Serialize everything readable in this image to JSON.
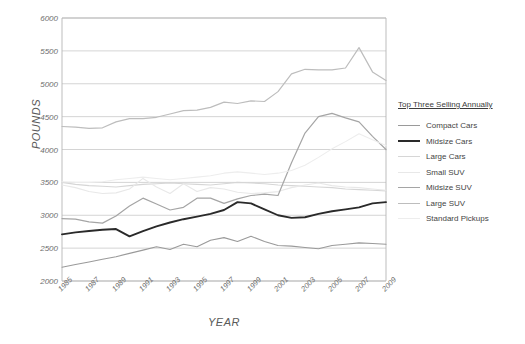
{
  "chart_data": {
    "type": "line",
    "title": "",
    "xlabel": "YEAR",
    "ylabel": "POUNDS",
    "ylim": [
      2000,
      6000
    ],
    "ytick_values": [
      2000,
      2500,
      3000,
      3500,
      4000,
      4500,
      5000,
      5500,
      6000
    ],
    "xlim": [
      1985,
      2009
    ],
    "grid": true,
    "legend_position": "right",
    "legend_title": "Top Three Selling Annually",
    "x": [
      1985,
      1986,
      1987,
      1988,
      1989,
      1990,
      1991,
      1992,
      1993,
      1994,
      1995,
      1996,
      1997,
      1998,
      1999,
      2000,
      2001,
      2002,
      2003,
      2004,
      2005,
      2006,
      2007,
      2008,
      2009
    ],
    "xtick_labels": [
      "1985",
      "1987",
      "1989",
      "1991",
      "1993",
      "1995",
      "1997",
      "1999",
      "2001",
      "2003",
      "2005",
      "2007",
      "2009"
    ],
    "series": [
      {
        "name": "Compact Cars",
        "color": "#9a9a9a",
        "width": 1.1,
        "values": [
          2210,
          2250,
          2290,
          2330,
          2370,
          2420,
          2470,
          2520,
          2480,
          2560,
          2520,
          2620,
          2660,
          2600,
          2680,
          2600,
          2540,
          2530,
          2510,
          2490,
          2540,
          2560,
          2580,
          2570,
          2560
        ]
      },
      {
        "name": "Midsize Cars",
        "color": "#2a2a2a",
        "width": 1.9,
        "values": [
          2710,
          2740,
          2760,
          2780,
          2790,
          2680,
          2760,
          2830,
          2890,
          2940,
          2980,
          3020,
          3080,
          3200,
          3180,
          3090,
          3000,
          2960,
          2970,
          3020,
          3060,
          3090,
          3120,
          3180,
          3200
        ]
      },
      {
        "name": "Large Cars",
        "color": "#d6d6d6",
        "width": 1.1,
        "values": [
          3500,
          3470,
          3450,
          3440,
          3430,
          3450,
          3470,
          3480,
          3490,
          3480,
          3470,
          3460,
          3480,
          3500,
          3490,
          3480,
          3460,
          3450,
          3440,
          3430,
          3420,
          3400,
          3390,
          3380,
          3370
        ]
      },
      {
        "name": "Small SUV",
        "color": "#e8e8e8",
        "width": 1.1,
        "values": [
          3460,
          3420,
          3360,
          3330,
          3340,
          3400,
          3560,
          3430,
          3330,
          3480,
          3360,
          3420,
          3400,
          3350,
          3330,
          3340,
          3360,
          3420,
          3460,
          3490,
          3450,
          3430,
          3420,
          3400,
          3380
        ]
      },
      {
        "name": "Midsize SUV",
        "color": "#a5a5a5",
        "width": 1.2,
        "values": [
          2950,
          2940,
          2900,
          2880,
          2990,
          3140,
          3260,
          3170,
          3080,
          3120,
          3260,
          3260,
          3180,
          3250,
          3300,
          3320,
          3300,
          3800,
          4250,
          4500,
          4550,
          4480,
          4420,
          4200,
          4000
        ]
      },
      {
        "name": "Large SUV",
        "color": "#bdbdbd",
        "width": 1.2,
        "values": [
          4350,
          4340,
          4320,
          4330,
          4420,
          4470,
          4470,
          4490,
          4540,
          4590,
          4600,
          4640,
          4720,
          4700,
          4740,
          4730,
          4880,
          5150,
          5220,
          5210,
          5210,
          5240,
          5550,
          5180,
          5050
        ]
      },
      {
        "name": "Standard Pickups",
        "color": "#ededed",
        "width": 1.1,
        "values": [
          3510,
          3500,
          3500,
          3510,
          3540,
          3560,
          3580,
          3560,
          3540,
          3560,
          3580,
          3600,
          3640,
          3660,
          3640,
          3620,
          3640,
          3680,
          3760,
          3880,
          4010,
          4120,
          4240,
          4150,
          4060
        ]
      }
    ]
  }
}
